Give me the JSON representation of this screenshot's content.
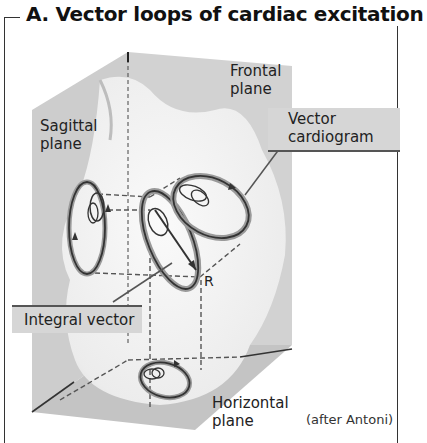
{
  "figure": {
    "title": "A.  Vector loops of cardiac excitation",
    "labels": {
      "sagittal": [
        "Sagittal",
        "plane"
      ],
      "frontal": [
        "Frontal",
        "plane"
      ],
      "horizontal": [
        "Horizontal",
        "plane"
      ],
      "vector_cardiogram": [
        "Vector",
        "cardiogram"
      ],
      "integral_vector": "Integral vector",
      "r_marker": "R"
    },
    "credit": "(after Antoni)"
  },
  "colors": {
    "plane_gray": "#c9c9c9",
    "body_white": "#f4f4f4",
    "loop_stroke": "#333333",
    "loop_halo": "#9a9a9a",
    "callout_bg": "#d6d6d6"
  }
}
